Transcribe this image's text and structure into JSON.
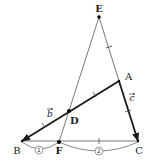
{
  "diagram": {
    "type": "geometry-figure",
    "points": {
      "E": {
        "label": "E",
        "x": 99,
        "y": 17
      },
      "A": {
        "label": "A",
        "x": 119,
        "y": 81
      },
      "D": {
        "label": "D",
        "x": 69,
        "y": 111
      },
      "B": {
        "label": "B",
        "x": 22,
        "y": 141
      },
      "F": {
        "label": "F",
        "x": 59,
        "y": 142
      },
      "C": {
        "label": "C",
        "x": 138,
        "y": 141
      }
    },
    "segments": [
      {
        "from": "E",
        "to": "F",
        "style": "thin"
      },
      {
        "from": "E",
        "to": "C",
        "style": "thin"
      },
      {
        "from": "B",
        "to": "C",
        "style": "thin"
      },
      {
        "from": "B",
        "to": "A",
        "style": "thick-vector"
      },
      {
        "from": "A",
        "to": "C",
        "style": "thick-vector"
      }
    ],
    "vectors": {
      "b": {
        "label": "b",
        "from": "B",
        "to": "A"
      },
      "c": {
        "label": "c",
        "from": "A",
        "to": "C"
      }
    },
    "ratios": {
      "BF": {
        "label": "1"
      },
      "FC": {
        "label": "2"
      }
    },
    "colors": {
      "line": "#444444",
      "thick_line": "#1a1a1a",
      "point": "#000000",
      "background": "#ffffff"
    }
  }
}
